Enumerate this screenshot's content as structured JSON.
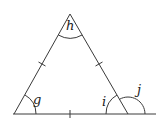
{
  "diagram": {
    "type": "geometry-triangle",
    "line_color": "#3a3a3a",
    "vertices": {
      "apex": {
        "x": 70,
        "y": 14
      },
      "bottom_left": {
        "x": 14,
        "y": 114
      },
      "bottom_right": {
        "x": 128,
        "y": 114
      }
    },
    "baseline_extension_end": {
      "x": 156,
      "y": 114
    },
    "tick_marks": [
      "left-side",
      "right-side",
      "base"
    ],
    "angles": {
      "g": {
        "label": "g",
        "location": "bottom-left interior"
      },
      "h": {
        "label": "h",
        "location": "apex interior"
      },
      "i": {
        "label": "i",
        "location": "bottom-right interior"
      },
      "j": {
        "label": "j",
        "location": "bottom-right exterior"
      }
    }
  }
}
